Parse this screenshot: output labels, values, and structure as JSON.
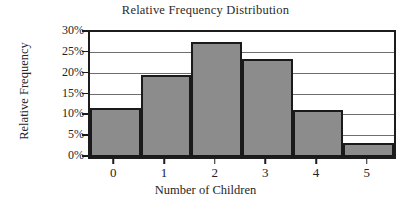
{
  "chart_data": {
    "type": "bar",
    "title": "Relative Frequency Distribution",
    "xlabel": "Number of Children",
    "ylabel": "Relative Frequency",
    "categories": [
      "0",
      "1",
      "2",
      "3",
      "4",
      "5"
    ],
    "values": [
      11.8,
      19.7,
      27.5,
      23.5,
      11.3,
      3.4
    ],
    "value_unit": "%",
    "ylim": [
      0,
      30
    ],
    "ytick_labels": [
      "0%",
      "5%",
      "10%",
      "15%",
      "20%",
      "25%",
      "30%"
    ],
    "ytick_values": [
      0,
      5,
      10,
      15,
      20,
      25,
      30
    ],
    "grid": true,
    "grid_axis": "y",
    "legend": null,
    "bar_fill_color": "#8c8c8c",
    "bar_edge_color": "#1a1a1a",
    "axis_color": "#1c1c1c",
    "grid_color": "#6e6e6e",
    "background_color": "#ffffff",
    "bar_gap": 0
  }
}
